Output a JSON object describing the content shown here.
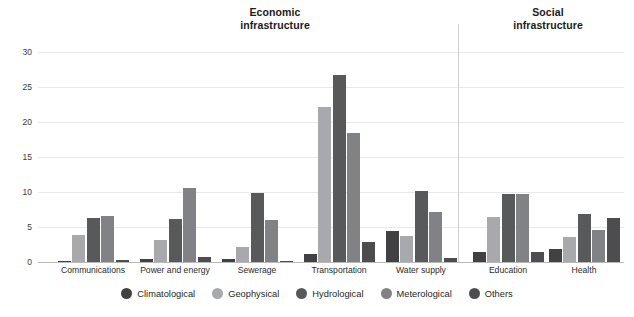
{
  "titles": {
    "economic_line1": "Economic",
    "economic_line2": "infrastructure",
    "social_line1": "Social",
    "social_line2": "infrastructure"
  },
  "legend": {
    "items": [
      {
        "label": "Climatological",
        "color": "#414042"
      },
      {
        "label": "Geophysical",
        "color": "#a7a9ac"
      },
      {
        "label": "Hydrological",
        "color": "#58595b"
      },
      {
        "label": "Meterological",
        "color": "#808285"
      },
      {
        "label": "Others",
        "color": "#4d4d4f"
      }
    ]
  },
  "chart_data": {
    "type": "bar",
    "title": "",
    "xlabel": "",
    "ylabel": "",
    "ylim": [
      0,
      30
    ],
    "yticks": [
      0,
      5,
      10,
      15,
      20,
      25,
      30
    ],
    "grid": true,
    "legend_position": "bottom",
    "sections": [
      {
        "name": "Economic infrastructure",
        "categories": [
          "Communications",
          "Power and energy",
          "Sewerage",
          "Transportation",
          "Water supply"
        ]
      },
      {
        "name": "Social infrastructure",
        "categories": [
          "Education",
          "Health"
        ]
      }
    ],
    "categories": [
      "Communications",
      "Power and energy",
      "Sewerage",
      "Transportation",
      "Water supply",
      "Education",
      "Health"
    ],
    "series": [
      {
        "name": "Climatological",
        "color": "#414042",
        "values": [
          0.1,
          0.4,
          0.4,
          1.2,
          4.4,
          1.5,
          1.9
        ]
      },
      {
        "name": "Geophysical",
        "color": "#a7a9ac",
        "values": [
          3.9,
          3.2,
          2.2,
          22.2,
          3.7,
          6.5,
          3.6
        ]
      },
      {
        "name": "Hydrological",
        "color": "#58595b",
        "values": [
          6.3,
          6.2,
          9.8,
          26.7,
          10.1,
          9.7,
          6.8
        ]
      },
      {
        "name": "Meterological",
        "color": "#808285",
        "values": [
          6.6,
          10.6,
          6.0,
          18.5,
          7.1,
          9.7,
          4.6
        ]
      },
      {
        "name": "Others",
        "color": "#4d4d4f",
        "values": [
          0.3,
          0.7,
          0.2,
          2.9,
          0.6,
          1.4,
          6.3
        ]
      }
    ]
  }
}
